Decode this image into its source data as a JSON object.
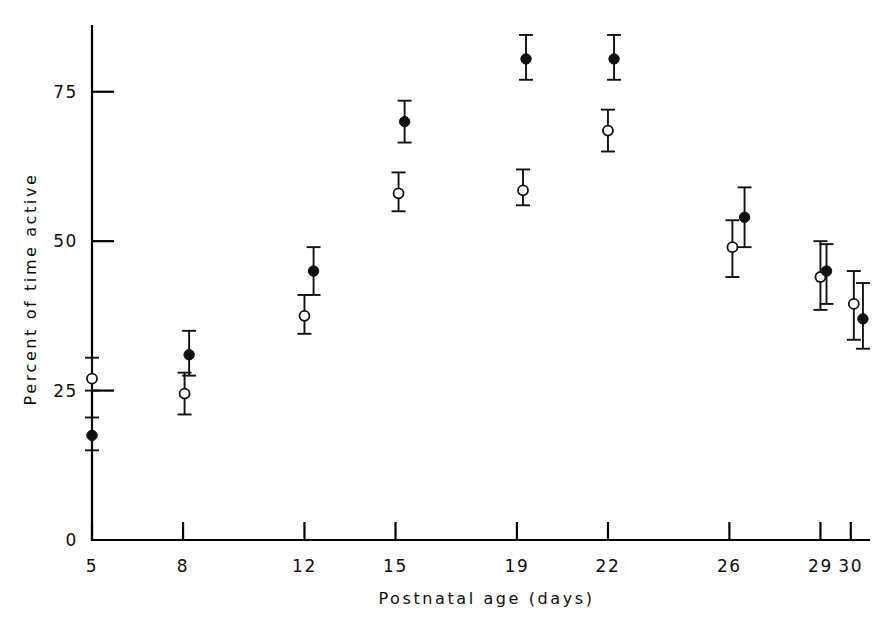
{
  "chart_data": {
    "type": "scatter",
    "title": "",
    "subtitle": "",
    "xlabel": "Postnatal age (days)",
    "ylabel": "Percent of time active",
    "xlim": [
      5,
      30.6
    ],
    "ylim": [
      0,
      88
    ],
    "grid": false,
    "legend_position": "none",
    "x_tick_labels": [
      "5",
      "8",
      "12",
      "15",
      "19",
      "22",
      "26",
      "29",
      "30"
    ],
    "x_tick_values": [
      5,
      8,
      12,
      15,
      19,
      22,
      26,
      29,
      30
    ],
    "y_tick_labels": [
      "0",
      "25",
      "50",
      "75"
    ],
    "y_tick_values": [
      0,
      25,
      50,
      75
    ],
    "annotations": [],
    "series": [
      {
        "name": "open-circle-group",
        "marker": "open-circle",
        "color": "#ffffff",
        "edge_color": "#111111",
        "points": [
          {
            "day": 5,
            "x": 5.0,
            "y": 27.0,
            "err_low": 25.0,
            "err_high": 30.5
          },
          {
            "day": 8,
            "x": 8.05,
            "y": 24.5,
            "err_low": 21.0,
            "err_high": 28.0
          },
          {
            "day": 12,
            "x": 12.0,
            "y": 37.5,
            "err_low": 34.5,
            "err_high": 41.0
          },
          {
            "day": 15,
            "x": 15.1,
            "y": 58.0,
            "err_low": 55.0,
            "err_high": 61.5
          },
          {
            "day": 19,
            "x": 19.2,
            "y": 58.5,
            "err_low": 56.0,
            "err_high": 62.0
          },
          {
            "day": 22,
            "x": 22.0,
            "y": 68.5,
            "err_low": 65.0,
            "err_high": 72.0
          },
          {
            "day": 26,
            "x": 26.1,
            "y": 49.0,
            "err_low": 44.0,
            "err_high": 53.5
          },
          {
            "day": 29,
            "x": 29.0,
            "y": 44.0,
            "err_low": 38.5,
            "err_high": 50.0
          },
          {
            "day": 30,
            "x": 30.1,
            "y": 39.5,
            "err_low": 33.5,
            "err_high": 45.0
          }
        ]
      },
      {
        "name": "filled-circle-group",
        "marker": "filled-circle",
        "color": "#101010",
        "edge_color": "#101010",
        "points": [
          {
            "day": 5,
            "x": 5.0,
            "y": 17.5,
            "err_low": 15.0,
            "err_high": 20.5
          },
          {
            "day": 8,
            "x": 8.2,
            "y": 31.0,
            "err_low": 27.5,
            "err_high": 35.0
          },
          {
            "day": 12,
            "x": 12.3,
            "y": 45.0,
            "err_low": 41.0,
            "err_high": 49.0
          },
          {
            "day": 15,
            "x": 15.3,
            "y": 70.0,
            "err_low": 66.5,
            "err_high": 73.5
          },
          {
            "day": 19,
            "x": 19.3,
            "y": 80.5,
            "err_low": 77.0,
            "err_high": 84.5
          },
          {
            "day": 22,
            "x": 22.2,
            "y": 80.5,
            "err_low": 77.0,
            "err_high": 84.5
          },
          {
            "day": 26,
            "x": 26.5,
            "y": 54.0,
            "err_low": 49.0,
            "err_high": 59.0
          },
          {
            "day": 29,
            "x": 29.2,
            "y": 45.0,
            "err_low": 39.5,
            "err_high": 49.5
          },
          {
            "day": 30,
            "x": 30.4,
            "y": 37.0,
            "err_low": 32.0,
            "err_high": 43.0
          }
        ]
      }
    ]
  }
}
